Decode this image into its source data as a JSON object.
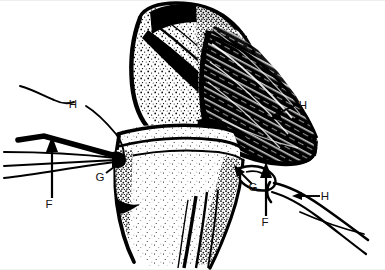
{
  "figure": {
    "kind": "anatomical-line-drawing",
    "background_color": "#ffffff",
    "ink_color": "#000000",
    "width": 385,
    "height": 270
  },
  "labels": [
    {
      "id": "label-h-left",
      "text": "H",
      "x": 73,
      "y": 108
    },
    {
      "id": "label-g-left",
      "text": "G",
      "x": 100,
      "y": 181
    },
    {
      "id": "label-f-left",
      "text": "F",
      "x": 49,
      "y": 208
    },
    {
      "id": "label-h-right-upper",
      "text": "H",
      "x": 303,
      "y": 109
    },
    {
      "id": "label-g-right",
      "text": "G",
      "x": 253,
      "y": 191
    },
    {
      "id": "label-f-right",
      "text": "F",
      "x": 265,
      "y": 226
    },
    {
      "id": "label-h-right-lower",
      "text": "H",
      "x": 325,
      "y": 200
    }
  ],
  "legend_keys": {
    "F": "F",
    "G": "G",
    "H": "H"
  },
  "annotation_count": {
    "total": 7,
    "f_markers": 2,
    "g_markers": 2,
    "h_markers": 3
  }
}
